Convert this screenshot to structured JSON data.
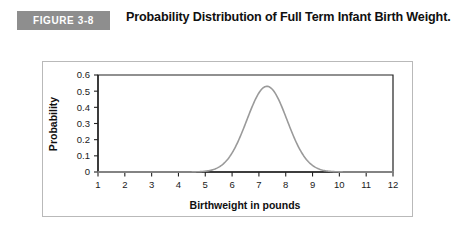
{
  "figure": {
    "badge_label": "FIGURE 3-8",
    "title": "Probability Distribution of Full Term Infant Birth Weight.",
    "badge_color": "#8e8e8e",
    "curve_color": "#9a9a9a",
    "axis_color": "#222222",
    "frame_color": "#b9b9b9"
  },
  "chart_data": {
    "type": "line",
    "title": "Probability Distribution of Full Term Infant Birth Weight.",
    "xlabel": "Birthweight in pounds",
    "ylabel": "Probability",
    "xlim": [
      1,
      12
    ],
    "ylim": [
      0,
      0.6
    ],
    "xticks": [
      1,
      2,
      3,
      4,
      5,
      6,
      7,
      8,
      9,
      10,
      11,
      12
    ],
    "xtick_labels": [
      "1",
      "2",
      "3",
      "4",
      "5",
      "6",
      "7",
      "8",
      "9",
      "10",
      "11",
      "12"
    ],
    "yticks": [
      0,
      0.1,
      0.2,
      0.3,
      0.4,
      0.5,
      0.6
    ],
    "ytick_labels": [
      "0",
      "0.1",
      "0.2",
      "0.3",
      "0.4",
      "0.5",
      "0.6"
    ],
    "grid": false,
    "legend": false,
    "distribution": {
      "kind": "normal",
      "mean": 7.3,
      "std": 0.75,
      "peak_value": 0.53
    },
    "series": [
      {
        "name": "Probability density",
        "x": [
          1.0,
          1.5,
          2.0,
          2.5,
          3.0,
          3.25,
          3.5,
          3.75,
          4.0,
          4.25,
          4.5,
          4.75,
          5.0,
          5.25,
          5.5,
          5.75,
          6.0,
          6.25,
          6.5,
          6.75,
          7.0,
          7.3,
          7.5,
          7.75,
          8.0,
          8.25,
          8.5,
          8.75,
          9.0,
          9.25,
          9.5,
          9.75,
          10.0,
          10.5,
          11.0,
          11.5,
          12.0
        ],
        "values": [
          0.0,
          0.0,
          0.0,
          0.0,
          0.0,
          0.001,
          0.002,
          0.004,
          0.009,
          0.018,
          0.033,
          0.057,
          0.092,
          0.139,
          0.197,
          0.262,
          0.327,
          0.39,
          0.442,
          0.487,
          0.516,
          0.532,
          0.528,
          0.516,
          0.487,
          0.442,
          0.39,
          0.327,
          0.262,
          0.197,
          0.139,
          0.092,
          0.057,
          0.018,
          0.004,
          0.001,
          0.0
        ]
      }
    ]
  }
}
